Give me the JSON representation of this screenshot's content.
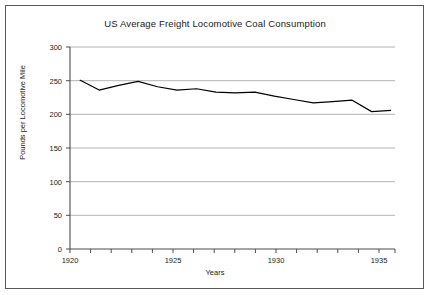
{
  "chart_data": {
    "type": "line",
    "title": "US Average Freight Locomotive Coal Consumption",
    "xlabel": "Years",
    "ylabel": "Pounds per Locomotive Mile",
    "x": [
      1920,
      1921,
      1922,
      1923,
      1924,
      1925,
      1926,
      1927,
      1928,
      1929,
      1930,
      1931,
      1932,
      1933,
      1934,
      1935,
      1936
    ],
    "values": [
      251,
      236,
      243,
      249,
      241,
      236,
      238,
      233,
      232,
      233,
      227,
      222,
      217,
      219,
      221,
      204,
      206
    ],
    "series": [
      {
        "name": "Pounds per Locomotive Mile",
        "values": [
          251,
          236,
          243,
          249,
          241,
          236,
          238,
          233,
          232,
          233,
          227,
          222,
          217,
          219,
          221,
          204,
          206
        ]
      }
    ],
    "xlim": [
      1919.5,
      1936.2
    ],
    "ylim": [
      0,
      300
    ],
    "yticks": [
      0,
      50,
      100,
      150,
      200,
      250,
      300
    ],
    "ytick_labels": [
      "0",
      "50",
      "100",
      "150",
      "200",
      "250",
      "300"
    ],
    "xticks": [
      1920,
      1925,
      1930,
      1935
    ],
    "xtick_labels": [
      "1920",
      "1925",
      "1930",
      "1935"
    ],
    "grid": "horizontal",
    "legend": "none",
    "line_color": "#000000",
    "grid_color": "#aaaaaa",
    "axis_color": "#4d4d4d",
    "background_color": "#ffffff"
  },
  "axis": {
    "y_label": "Pounds per Locomotive Mile",
    "x_label": "Years",
    "ytick_0": "0",
    "ytick_1": "50",
    "ytick_2": "100",
    "ytick_3": "150",
    "ytick_4": "200",
    "ytick_5": "250",
    "ytick_6": "300",
    "xtick_0": "1920",
    "xtick_1": "1925",
    "xtick_2": "1930",
    "xtick_3": "1935"
  },
  "title": "US Average Freight Locomotive Coal Consumption"
}
